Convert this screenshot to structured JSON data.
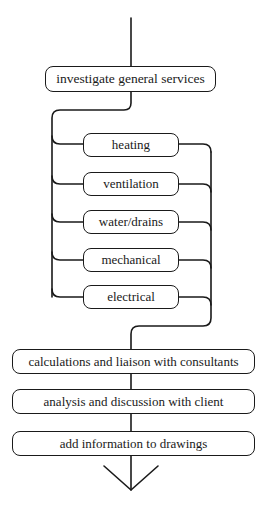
{
  "diagram": {
    "type": "flowchart",
    "start_node": {
      "label": "investigate general services"
    },
    "parallel_nodes": [
      {
        "label": "heating"
      },
      {
        "label": "ventilation"
      },
      {
        "label": "water/drains"
      },
      {
        "label": "mechanical"
      },
      {
        "label": "electrical"
      }
    ],
    "sequential_nodes": [
      {
        "label": "calculations and liaison with consultants"
      },
      {
        "label": "analysis and discussion with client"
      },
      {
        "label": "add information to drawings"
      }
    ],
    "end": {
      "icon": "arrow-down-icon"
    },
    "colors": {
      "stroke": "#1a1a1a",
      "background": "#ffffff"
    }
  }
}
